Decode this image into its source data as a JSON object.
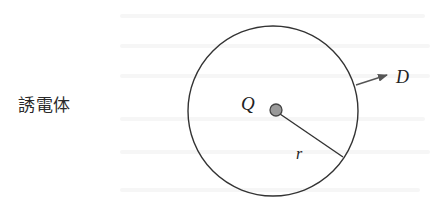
{
  "diagram": {
    "medium_label": "誘電体",
    "charge_label": "Q",
    "radius_label": "r",
    "field_label": "D",
    "colors": {
      "stroke": "#333333",
      "charge_fill": "#9a9a9a",
      "charge_stroke": "#444444",
      "text": "#222222",
      "background": "#ffffff"
    },
    "elements": {
      "sphere": {
        "cx": 273,
        "cy": 111,
        "r": 85
      },
      "charge": {
        "cx": 276,
        "cy": 110,
        "r": 6
      },
      "radius_line": {
        "x1": 280,
        "y1": 114,
        "x2": 343,
        "y2": 157
      },
      "d_arrow": {
        "x1": 356,
        "y1": 85,
        "x2": 387,
        "y2": 75
      }
    }
  }
}
